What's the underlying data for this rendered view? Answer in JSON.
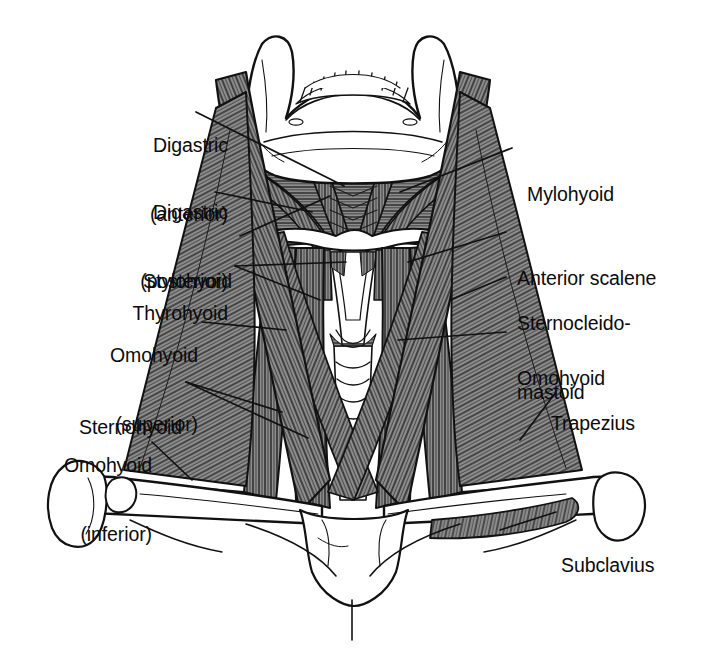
{
  "figure": {
    "view": "anterior",
    "line_color": "#111111",
    "muscle_fill": "#8d8d8d",
    "muscle_stripe": "#1b1b1b",
    "bone_fill": "#ffffff",
    "background": "#ffffff"
  },
  "labels_left": [
    {
      "id": "digastric-anterior",
      "lines": [
        "Digastric",
        "(anterior)"
      ]
    },
    {
      "id": "digastric-posterior",
      "lines": [
        "Digastric",
        "(posterior)"
      ]
    },
    {
      "id": "stylohyoid",
      "lines": [
        "Stylohyoid"
      ]
    },
    {
      "id": "thyrohyoid",
      "lines": [
        "Thyrohyoid"
      ]
    },
    {
      "id": "omohyoid-superior",
      "lines": [
        "Omohyoid",
        "(superior)"
      ]
    },
    {
      "id": "sternohyoid",
      "lines": [
        "Sternohyoid"
      ]
    },
    {
      "id": "omohyoid-inferior",
      "lines": [
        "Omohyoid",
        "(inferior)"
      ]
    }
  ],
  "labels_right": [
    {
      "id": "mylohyoid",
      "lines": [
        "Mylohyoid"
      ]
    },
    {
      "id": "anterior-scalene",
      "lines": [
        "Anterior scalene"
      ]
    },
    {
      "id": "sternocleidomastoid",
      "lines": [
        "Sternocleido-",
        "mastoid"
      ]
    },
    {
      "id": "omohyoid",
      "lines": [
        "Omohyoid"
      ]
    },
    {
      "id": "trapezius",
      "lines": [
        "Trapezius"
      ]
    },
    {
      "id": "subclavius",
      "lines": [
        "Subclavius"
      ]
    }
  ],
  "structures": [
    "mandible",
    "teeth",
    "hyoid-bone",
    "thyroid-cartilage",
    "trachea",
    "clavicle-left",
    "clavicle-right",
    "sternum",
    "scapula-left",
    "scapula-right"
  ]
}
